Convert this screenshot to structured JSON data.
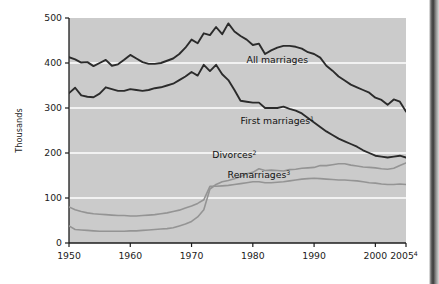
{
  "chart_data": {
    "type": "line",
    "title": "",
    "xlabel": "",
    "ylabel": "Thousands",
    "xlim": [
      1950,
      2005
    ],
    "ylim": [
      0,
      500
    ],
    "grid": true,
    "grid_lines_y": [
      100,
      200,
      300,
      400
    ],
    "legend_position": "inline-annotations",
    "plot_background": "#c9c9c9",
    "xticks": [
      1950,
      1960,
      1970,
      1980,
      1990,
      2000,
      2005
    ],
    "xtick_labels": [
      "1950",
      "1960",
      "1970",
      "1980",
      "1990",
      "2000",
      "2005"
    ],
    "xtick_last_superscript": "4",
    "yticks": [
      0,
      100,
      200,
      300,
      400,
      500
    ],
    "ytick_labels": [
      "0",
      "100",
      "200",
      "300",
      "400",
      "500"
    ],
    "x": [
      1950,
      1951,
      1952,
      1953,
      1954,
      1955,
      1956,
      1957,
      1958,
      1959,
      1960,
      1961,
      1962,
      1963,
      1964,
      1965,
      1966,
      1967,
      1968,
      1969,
      1970,
      1971,
      1972,
      1973,
      1974,
      1975,
      1976,
      1977,
      1978,
      1979,
      1980,
      1981,
      1982,
      1983,
      1984,
      1985,
      1986,
      1987,
      1988,
      1989,
      1990,
      1991,
      1992,
      1993,
      1994,
      1995,
      1996,
      1997,
      1998,
      1999,
      2000,
      2001,
      2002,
      2003,
      2004,
      2005
    ],
    "series": [
      {
        "name": "All marriages",
        "label": "All marriages",
        "superscript": "",
        "color": "#2b2b2b",
        "width": 1.9,
        "values": [
          413,
          408,
          401,
          402,
          393,
          400,
          407,
          394,
          397,
          407,
          418,
          410,
          402,
          398,
          398,
          400,
          405,
          410,
          420,
          434,
          452,
          444,
          466,
          462,
          480,
          464,
          488,
          470,
          460,
          452,
          440,
          443,
          420,
          428,
          434,
          438,
          438,
          436,
          432,
          424,
          420,
          412,
          394,
          383,
          370,
          361,
          352,
          346,
          340,
          334,
          323,
          318,
          307,
          319,
          314,
          292
        ]
      },
      {
        "name": "First marriages",
        "label": "First marriages",
        "superscript": "1",
        "color": "#2b2b2b",
        "width": 1.9,
        "values": [
          333,
          345,
          328,
          325,
          324,
          332,
          346,
          342,
          338,
          338,
          342,
          340,
          338,
          340,
          344,
          346,
          350,
          354,
          362,
          370,
          380,
          372,
          396,
          382,
          396,
          375,
          362,
          340,
          316,
          314,
          312,
          312,
          300,
          300,
          300,
          303,
          298,
          294,
          288,
          278,
          268,
          258,
          248,
          240,
          232,
          226,
          220,
          214,
          206,
          200,
          194,
          192,
          190,
          192,
          194,
          190
        ]
      },
      {
        "name": "Divorces",
        "label": "Divorces",
        "superscript": "2",
        "color": "#949494",
        "width": 1.6,
        "values": [
          38,
          30,
          29,
          28,
          27,
          26,
          26,
          26,
          26,
          26,
          27,
          27,
          28,
          29,
          30,
          31,
          32,
          34,
          38,
          42,
          48,
          58,
          74,
          120,
          130,
          136,
          139,
          143,
          148,
          154,
          157,
          165,
          161,
          162,
          161,
          160,
          163,
          164,
          166,
          167,
          168,
          172,
          172,
          174,
          176,
          176,
          173,
          171,
          169,
          168,
          167,
          165,
          164,
          166,
          172,
          178
        ]
      },
      {
        "name": "Remarriages",
        "label": "Remarriages",
        "superscript": "3",
        "color": "#949494",
        "width": 1.6,
        "values": [
          80,
          74,
          70,
          67,
          65,
          64,
          63,
          62,
          61,
          61,
          60,
          60,
          61,
          62,
          63,
          65,
          67,
          70,
          73,
          78,
          82,
          88,
          96,
          126,
          126,
          127,
          128,
          130,
          132,
          134,
          136,
          136,
          134,
          134,
          135,
          136,
          138,
          140,
          142,
          143,
          144,
          143,
          142,
          141,
          140,
          140,
          139,
          138,
          136,
          134,
          133,
          131,
          130,
          130,
          131,
          130
        ]
      }
    ],
    "annotations": [
      {
        "text": "All marriages",
        "superscript": "",
        "x": 1984,
        "y": 400
      },
      {
        "text": "First marriages",
        "superscript": "1",
        "x": 1984,
        "y": 265
      },
      {
        "text": "Divorces",
        "superscript": "2",
        "x": 1977,
        "y": 190
      },
      {
        "text": "Remarriages",
        "superscript": "3",
        "x": 1981,
        "y": 145
      }
    ]
  }
}
